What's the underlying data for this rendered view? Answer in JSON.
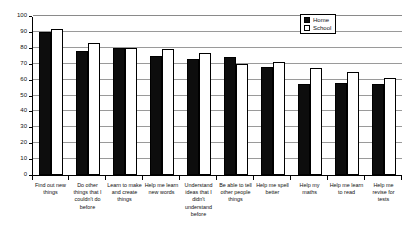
{
  "chart_data": {
    "type": "bar",
    "title": "",
    "subtitle": "",
    "xlabel": "",
    "ylabel": "",
    "ylim": [
      0,
      100
    ],
    "yticks": [
      0,
      10,
      20,
      30,
      40,
      50,
      60,
      70,
      80,
      90,
      100
    ],
    "grid": true,
    "legend_position": "top-right",
    "categories": [
      "Find out new things",
      "Do other things that I couldn't do before",
      "Learn to make and create things",
      "Help me learn new words",
      "Understand ideas that I didn't understand before",
      "Be able to tell other people things",
      "Help me spell better",
      "Help my maths",
      "Help me learn to read",
      "Help me revise for tests"
    ],
    "series": [
      {
        "name": "Home",
        "color": "#0d0d0d",
        "values": [
          90,
          78,
          80,
          75,
          73,
          74,
          68,
          57,
          58,
          57
        ]
      },
      {
        "name": "School",
        "color": "#ffffff",
        "values": [
          92,
          83,
          80,
          79,
          77,
          70,
          71,
          67,
          65,
          61
        ]
      }
    ]
  },
  "legend": {
    "items": [
      {
        "label": "Home"
      },
      {
        "label": "School"
      }
    ]
  },
  "axis": {
    "y_tick_labels": [
      "100",
      "90",
      "80",
      "70",
      "60",
      "50",
      "40",
      "30",
      "20",
      "10",
      "0"
    ]
  }
}
